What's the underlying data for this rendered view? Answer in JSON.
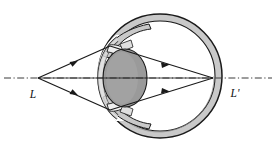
{
  "figure": {
    "name": "human-eye-ray-diagram",
    "width": 276,
    "height": 146,
    "background_color": "#ffffff"
  },
  "labels": {
    "object_point": "L",
    "image_point": "L'"
  },
  "colors": {
    "stroke": "#1a1a1a",
    "sclera_fill": "#c9c9c9",
    "interior_fill": "#ffffff",
    "lens_fill": "#9a9a9a",
    "cornea_fill": "#cfcfcf",
    "iris_fill": "#e8e8e8",
    "axis_color": "#3a3a3a",
    "ray_color": "#1a1a1a"
  },
  "geometry": {
    "optical_axis": {
      "y": 78,
      "x_start": 4,
      "x_end": 272,
      "style": "dash-dot"
    },
    "object_vertex": {
      "x": 38,
      "y": 78
    },
    "image_vertex": {
      "x": 213,
      "y": 78
    },
    "eyeball": {
      "center_x": 160,
      "center_y": 76,
      "outer_radius": 62,
      "inner_radius": 55
    },
    "lens": {
      "center_x": 125,
      "center_y": 78,
      "rx": 22,
      "ry": 29
    },
    "cornea": {
      "apex_x": 99,
      "top_y": 38,
      "bottom_y": 118
    }
  },
  "rays": [
    {
      "name": "upper-ray",
      "from": "L",
      "to": "L'",
      "via_y": 46,
      "arrowheads": 2
    },
    {
      "name": "lower-ray",
      "from": "L",
      "to": "L'",
      "via_y": 110,
      "arrowheads": 2
    }
  ],
  "annotations": {
    "label_object_position": {
      "x": 33,
      "y": 97
    },
    "label_image_position": {
      "x": 234,
      "y": 96
    }
  }
}
